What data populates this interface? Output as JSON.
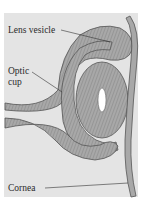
{
  "figure": {
    "labels": {
      "lens_vesicle": "Lens vesicle",
      "optic_cup_line1": "Optic",
      "optic_cup_line2": "cup",
      "cornea": "Cornea"
    },
    "colors": {
      "background_panel": "#e4e4e4",
      "tissue_fill": "#a8a8a8",
      "tissue_stroke": "#555555",
      "label_text": "#2a2a2a"
    }
  }
}
